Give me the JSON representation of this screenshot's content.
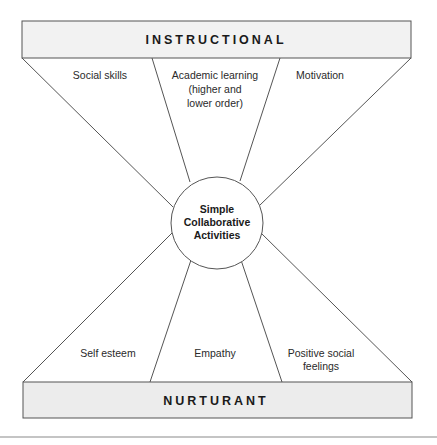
{
  "colors": {
    "top_band_fill": "#f2f2f2",
    "bottom_band_fill": "#ececec",
    "stroke": "#555555",
    "text": "#1a1a1a",
    "separator": "#b0b0b0"
  },
  "diagram": {
    "top_band": {
      "title": "INSTRUCTIONAL"
    },
    "bottom_band": {
      "title": "NURTURANT"
    },
    "hub": {
      "lines": [
        "Simple",
        "Collaborative",
        "Activities"
      ]
    },
    "top_outcomes": [
      {
        "lines": [
          "Social skills"
        ]
      },
      {
        "lines": [
          "Academic learning",
          "(higher and",
          "lower order)"
        ]
      },
      {
        "lines": [
          "Motivation"
        ]
      }
    ],
    "bottom_outcomes": [
      {
        "lines": [
          "Self esteem"
        ]
      },
      {
        "lines": [
          "Empathy"
        ]
      },
      {
        "lines": [
          "Positive social",
          "feelings"
        ]
      }
    ]
  }
}
